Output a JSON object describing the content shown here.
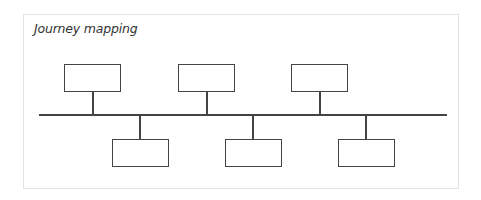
{
  "diagram": {
    "title": "Journey mapping",
    "type": "timeline",
    "line_color": "#444444",
    "border_color": "#e2e2e2",
    "top_nodes": [
      {
        "label": ""
      },
      {
        "label": ""
      },
      {
        "label": ""
      }
    ],
    "bottom_nodes": [
      {
        "label": ""
      },
      {
        "label": ""
      },
      {
        "label": ""
      }
    ]
  }
}
